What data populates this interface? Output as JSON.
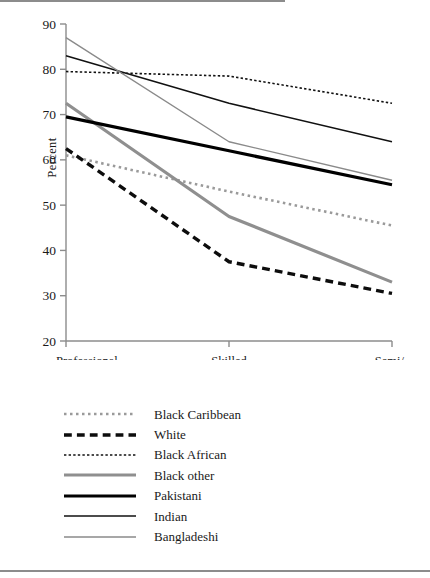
{
  "chart_data": {
    "type": "line",
    "title": "",
    "xlabel": "",
    "ylabel": "Percent",
    "categories": [
      "Professional",
      "Skilled",
      "Semi/\nunskilled"
    ],
    "category_labels": [
      {
        "line1": "Professional",
        "line2": ""
      },
      {
        "line1": "Skilled",
        "line2": ""
      },
      {
        "line1": "Semi/",
        "line2": "unskilled"
      }
    ],
    "ylim": [
      20,
      90
    ],
    "yticks": [
      20,
      30,
      40,
      50,
      60,
      70,
      80,
      90
    ],
    "grid": false,
    "legend_position": "below",
    "series": [
      {
        "name": "Black Caribbean",
        "values": [
          61.0,
          53.0,
          45.5
        ],
        "style": "dotted",
        "color": "#9a9a9a",
        "width": 2.6
      },
      {
        "name": "White",
        "values": [
          62.5,
          37.5,
          30.5
        ],
        "style": "dashed",
        "color": "#0d0d0d",
        "width": 3.4
      },
      {
        "name": "Black African",
        "values": [
          79.5,
          78.5,
          72.5
        ],
        "style": "fine-dotted",
        "color": "#111111",
        "width": 1.6
      },
      {
        "name": "Black other",
        "values": [
          72.5,
          47.5,
          33.0
        ],
        "style": "solid",
        "color": "#8f8f8f",
        "width": 3.2
      },
      {
        "name": "Pakistani",
        "values": [
          69.5,
          62.0,
          54.5
        ],
        "style": "solid",
        "color": "#000000",
        "width": 3.2
      },
      {
        "name": "Indian",
        "values": [
          83.0,
          72.5,
          64.0
        ],
        "style": "solid",
        "color": "#111111",
        "width": 1.5
      },
      {
        "name": "Bangladeshi",
        "values": [
          87.0,
          64.0,
          55.5
        ],
        "style": "solid",
        "color": "#8a8a8a",
        "width": 1.4
      }
    ]
  },
  "axis": {
    "y_label": "Percent",
    "y_tick_labels": [
      "90",
      "80",
      "70",
      "60",
      "50",
      "40",
      "30",
      "20"
    ],
    "x_tick_labels": [
      "Professional",
      "Skilled",
      "Semi/",
      "unskilled"
    ]
  },
  "legend": {
    "items": [
      {
        "label": "Black Caribbean"
      },
      {
        "label": "White"
      },
      {
        "label": "Black African"
      },
      {
        "label": "Black other"
      },
      {
        "label": "Pakistani"
      },
      {
        "label": "Indian"
      },
      {
        "label": "Bangladeshi"
      }
    ]
  },
  "colors": {
    "axis": "#8c8c8c",
    "rule": "#8c8c8c",
    "text": "#1a1a1a"
  }
}
